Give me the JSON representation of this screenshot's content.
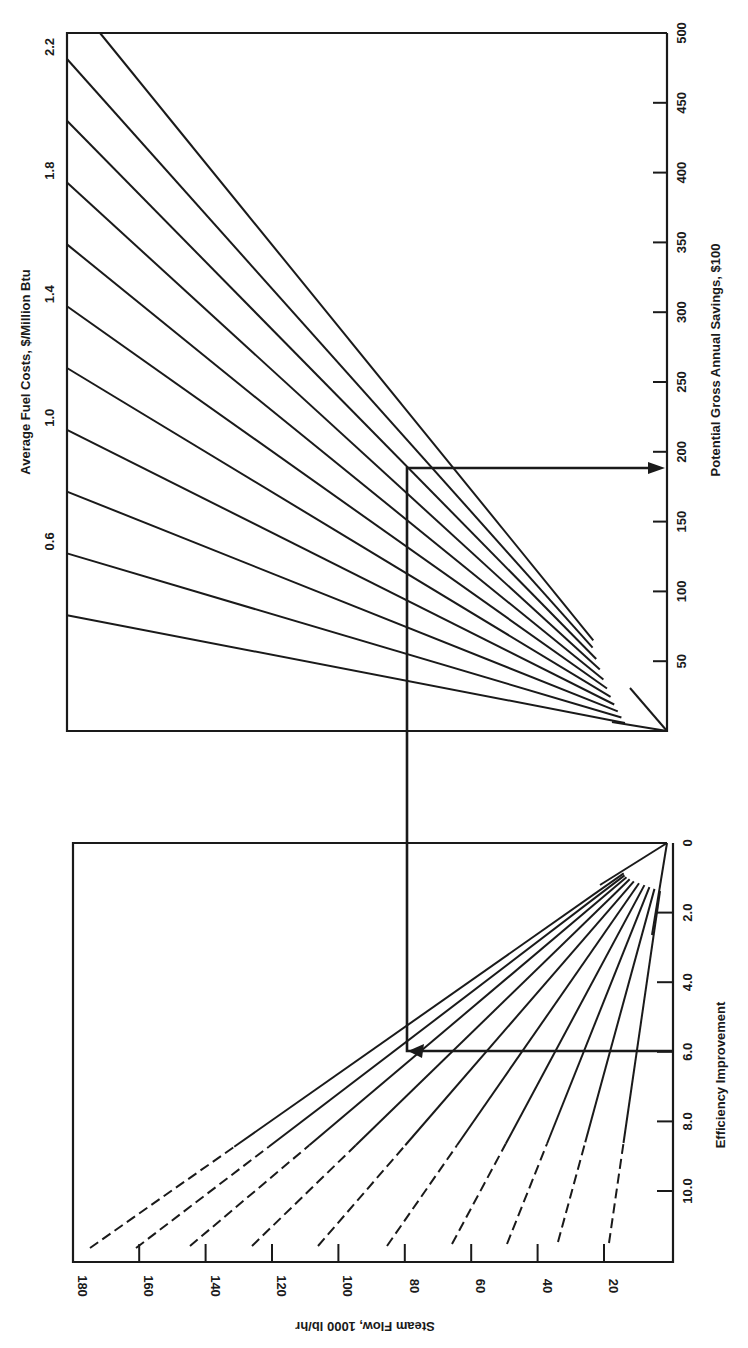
{
  "chart_data": {
    "type": "line",
    "orientation": "rotated 90 degrees clockwise",
    "panels": [
      {
        "name": "fuel-cost-panel",
        "xlabel": "Average Fuel Costs, $/Million Btu",
        "ylabel": "Potential Gross Annual Savings, $100",
        "fuel_cost_ticks": [
          "0.6",
          "1.0",
          "1.4",
          "1.8",
          "2.2"
        ],
        "savings_ticks": [
          "50",
          "100",
          "150",
          "200",
          "250",
          "300",
          "350",
          "400",
          "450",
          "500"
        ],
        "fuel_cost_lines": [
          0.4,
          0.6,
          0.8,
          1.0,
          1.2,
          1.4,
          1.6,
          1.8,
          2.0,
          2.2,
          2.4
        ],
        "savings_range": [
          0,
          500
        ]
      },
      {
        "name": "steam-flow-panel",
        "xlabel": "Efficiency Improvement",
        "ylabel": "Steam Flow, 1000 lb/hr",
        "efficiency_ticks": [
          "0",
          "2.0",
          "4.0",
          "6.0",
          "8.0",
          "10.0"
        ],
        "steam_flow_ticks": [
          "20",
          "40",
          "60",
          "80",
          "100",
          "120",
          "140",
          "160",
          "180"
        ],
        "steam_flow_lines": [
          20,
          40,
          60,
          80,
          100,
          120,
          140,
          160,
          180
        ],
        "efficiency_range": [
          0,
          12
        ]
      }
    ],
    "example_path": {
      "efficiency_improvement": 6.0,
      "steam_flow": 80,
      "fuel_cost": 1.0,
      "savings": 190
    }
  },
  "labels": {
    "fuel_cost_axis": "Average Fuel Costs, $/Million Btu",
    "savings_axis": "Potential Gross Annual Savings, $100",
    "efficiency_axis": "Efficiency Improvement",
    "steam_flow_axis": "Steam Flow, 1000 lb/hr"
  },
  "colors": {
    "ink": "#1a1a1a",
    "background": "#ffffff"
  }
}
